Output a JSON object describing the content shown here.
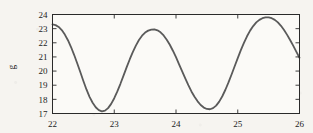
{
  "figure": {
    "background_color": "#f6f4f0",
    "frame_color": "#2a2a2a",
    "ylabel": "g"
  },
  "chart_data": {
    "type": "line",
    "title": "",
    "subtitle": "",
    "xlabel": "",
    "ylabel": "g",
    "xlim": [
      22,
      26
    ],
    "ylim": [
      17,
      24
    ],
    "xticks": [
      22,
      23,
      24,
      25,
      26
    ],
    "xticklabels": [
      "22",
      "23",
      "24",
      "25",
      "26"
    ],
    "yticks": [
      17,
      18,
      19,
      20,
      21,
      22,
      23,
      24
    ],
    "yticklabels": [
      "17",
      "18",
      "19",
      "20",
      "21",
      "22",
      "23",
      "24"
    ],
    "grid": false,
    "legend": null,
    "legend_position": "none",
    "annotations": [],
    "series": [
      {
        "name": "g",
        "color": "#5a5a5a",
        "line_width": 1.8,
        "period": 1.0,
        "description": "Periodic oscillation with slowly growing amplitude; minima near x=22.5, 23.5, 24.5, 25.5 and maxima near x=23, 24, 25, 26.",
        "x": [
          22.0,
          22.05,
          22.1,
          22.15,
          22.2,
          22.25,
          22.3,
          22.35,
          22.4,
          22.45,
          22.5,
          22.55,
          22.6,
          22.65,
          22.7,
          22.75,
          22.8,
          22.85,
          22.9,
          22.95,
          23.0,
          23.05,
          23.1,
          23.15,
          23.2,
          23.25,
          23.3,
          23.35,
          23.4,
          23.45,
          23.5,
          23.55,
          23.6,
          23.65,
          23.7,
          23.75,
          23.8,
          23.85,
          23.9,
          23.95,
          24.0,
          24.05,
          24.1,
          24.15,
          24.2,
          24.25,
          24.3,
          24.35,
          24.4,
          24.45,
          24.5,
          24.55,
          24.6,
          24.65,
          24.7,
          24.75,
          24.8,
          24.85,
          24.9,
          24.95,
          25.0,
          25.05,
          25.1,
          25.15,
          25.2,
          25.25,
          25.3,
          25.35,
          25.4,
          25.45,
          25.5,
          25.55,
          25.6,
          25.65,
          25.7,
          25.75,
          25.8,
          25.85,
          25.9,
          25.95,
          26.0
        ],
        "y": [
          23.3,
          23.25,
          23.12,
          22.9,
          22.58,
          22.18,
          21.7,
          21.15,
          20.55,
          19.93,
          19.3,
          18.7,
          18.18,
          17.76,
          17.44,
          17.24,
          17.15,
          17.2,
          17.38,
          17.68,
          18.08,
          18.56,
          19.1,
          19.68,
          20.26,
          20.82,
          21.34,
          21.8,
          22.2,
          22.5,
          22.72,
          22.86,
          22.93,
          22.94,
          22.88,
          22.74,
          22.52,
          22.22,
          21.86,
          21.44,
          20.98,
          20.48,
          19.98,
          19.48,
          19.0,
          18.56,
          18.18,
          17.86,
          17.6,
          17.42,
          17.32,
          17.3,
          17.38,
          17.56,
          17.84,
          18.22,
          18.68,
          19.2,
          19.76,
          20.34,
          20.92,
          21.48,
          22.0,
          22.46,
          22.86,
          23.18,
          23.44,
          23.62,
          23.74,
          23.8,
          23.8,
          23.74,
          23.62,
          23.44,
          23.2,
          22.9,
          22.56,
          22.18,
          21.78,
          21.36,
          20.94
        ]
      }
    ]
  }
}
